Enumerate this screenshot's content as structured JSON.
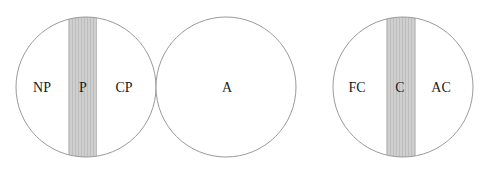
{
  "colors": {
    "outline": "#9a9a9a",
    "band_fill": "#cfcfcf",
    "band_stripe": "#bdbdbd",
    "text": "#1a1a1a",
    "background": "#ffffff"
  },
  "circles": [
    {
      "id": "left",
      "cx": 86,
      "cy": 87,
      "r": 70,
      "band": {
        "x": 68,
        "width": 29
      },
      "labels": {
        "left": "NP",
        "center": "P",
        "right": "CP"
      }
    },
    {
      "id": "middle",
      "cx": 226,
      "cy": 87,
      "r": 70,
      "band": null,
      "labels": {
        "center": "A"
      }
    },
    {
      "id": "right",
      "cx": 403,
      "cy": 87,
      "r": 70,
      "band": {
        "x": 386,
        "width": 30
      },
      "labels": {
        "left": "FC",
        "center": "C",
        "right": "AC"
      }
    }
  ]
}
